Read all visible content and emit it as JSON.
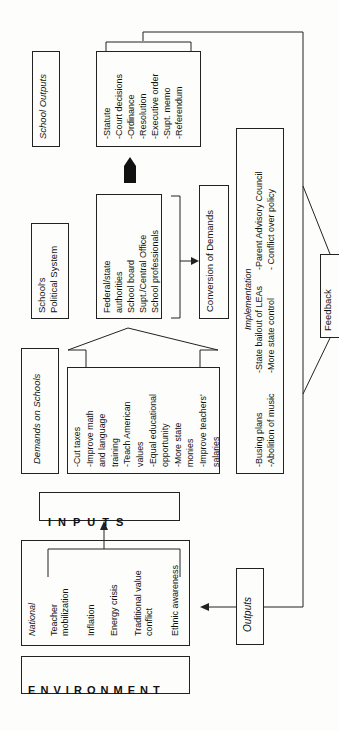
{
  "environment": {
    "label_letters": "E N V I R O N M E N T"
  },
  "national": {
    "heading": "National",
    "items": [
      "Teacher\nmobilization",
      "Inflation",
      "Energy crisis",
      "Traditional value\nconflict",
      "Ethnic awareness"
    ]
  },
  "inputs": {
    "label_letters": "I N P U T S"
  },
  "outputs_box": {
    "label": "Outputs"
  },
  "demands": {
    "title": "Demands on Schools",
    "items": "-Cut taxes\n-Improve math\nand language\ntraining\n-Teach American\nvalues\n-Equal educational\nopportunity\n-More state\nmonies\n-Improve teachers'\nsalaries"
  },
  "political_system": {
    "title": "School's\nPolitical System",
    "members": "Federal/state\nauthorities\nSchool board\nSupt./Central Office\nSchool professionals"
  },
  "conversion": {
    "label": "Conversion of Demands"
  },
  "school_outputs": {
    "title": "School Outputs",
    "items": "-Statute\n-Court decisions\n-Ordinance\n-Resolution\n-Executive order\n-Supt. memo\n-Referendum"
  },
  "implementation": {
    "title": "Implementation",
    "col1": "-Busing plans\n-Abolition of music",
    "col2": "-State bailout of LEAs\n-More state control",
    "col3": "-Parent Advisory Council\n- Conflict over policy"
  },
  "feedback": {
    "label": "Feedback"
  }
}
